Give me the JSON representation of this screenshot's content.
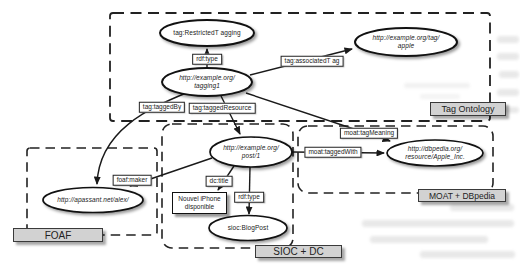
{
  "diagram": {
    "groups": [
      {
        "id": "tag-ontology",
        "label": "Tag Ontology"
      },
      {
        "id": "foaf",
        "label": "FOAF"
      },
      {
        "id": "sioc-dc",
        "label": "SIOC + DC"
      },
      {
        "id": "moat-dbpedia",
        "label": "MOAT + DBpedia"
      }
    ],
    "nodes": [
      {
        "id": "restricted-tagging",
        "shape": "ellipse",
        "line1": "tag:RestrictedT agging",
        "line2": ""
      },
      {
        "id": "tagging1",
        "shape": "ellipse",
        "line1": "http://example.org/",
        "line2": "tagging1"
      },
      {
        "id": "tag-apple",
        "shape": "ellipse",
        "line1": "http://example.org/tag/",
        "line2": "apple"
      },
      {
        "id": "post1",
        "shape": "ellipse",
        "line1": "http://example.org/",
        "line2": "post/1"
      },
      {
        "id": "alex",
        "shape": "ellipse",
        "line1": "http://apassant.net/alex/",
        "line2": ""
      },
      {
        "id": "blogpost",
        "shape": "ellipse",
        "line1": "sioc:BlogPost",
        "line2": ""
      },
      {
        "id": "apple-inc",
        "shape": "ellipse",
        "line1": "http://dbpedia.org/",
        "line2": "resource/Apple_Inc."
      },
      {
        "id": "iphone-title",
        "shape": "rect",
        "line1": "Nouvel iPhone",
        "line2": "disponible"
      }
    ],
    "edges": [
      {
        "from": "tagging1",
        "to": "restricted-tagging",
        "label": "rdf:type"
      },
      {
        "from": "tagging1",
        "to": "tag-apple",
        "label": "tag:associatedT ag"
      },
      {
        "from": "tagging1",
        "to": "alex",
        "label": "tag:taggedBy"
      },
      {
        "from": "tagging1",
        "to": "post1",
        "label": "tag:taggedResource"
      },
      {
        "from": "tagging1",
        "to": "apple-inc",
        "label": "moat:tagMeaning"
      },
      {
        "from": "post1",
        "to": "apple-inc",
        "label": "moat:taggedWith"
      },
      {
        "from": "post1",
        "to": "alex",
        "label": "foaf:maker"
      },
      {
        "from": "post1",
        "to": "iphone-title",
        "label": "dc:title"
      },
      {
        "from": "post1",
        "to": "blogpost",
        "label": "rdf:type"
      }
    ],
    "colors": {
      "node_fill": "#ffffff",
      "stroke": "#1a1a1a",
      "group_label_bg": "#d2d2d2",
      "background": "#ffffff"
    }
  }
}
